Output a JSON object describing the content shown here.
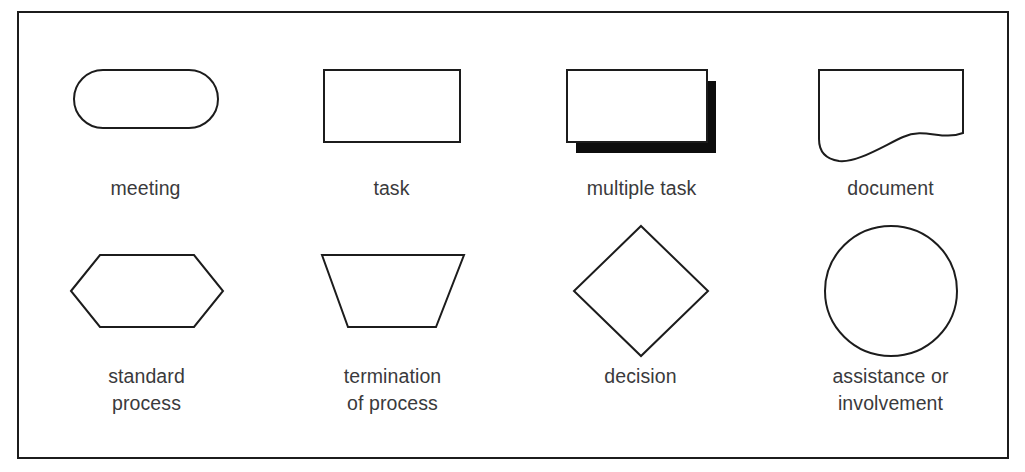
{
  "diagram": {
    "kind": "flowchart-symbol-legend",
    "frame": {
      "border_color": "#1c1c1c",
      "background_color": "#ffffff"
    },
    "label_color": "#3a3a3c",
    "rows": [
      {
        "name": "top-row",
        "items": [
          {
            "id": "meeting",
            "shape": "stadium",
            "label": "meeting"
          },
          {
            "id": "task",
            "shape": "rectangle",
            "label": "task"
          },
          {
            "id": "multiple-task",
            "shape": "stacked-rectangles",
            "label": "multiple task"
          },
          {
            "id": "document",
            "shape": "document-wave",
            "label": "document"
          }
        ]
      },
      {
        "name": "bottom-row",
        "items": [
          {
            "id": "standard-process",
            "shape": "hexagon",
            "label": "standard\nprocess"
          },
          {
            "id": "termination-process",
            "shape": "trapezoid",
            "label": "termination\nof process"
          },
          {
            "id": "decision",
            "shape": "diamond",
            "label": "decision"
          },
          {
            "id": "assistance",
            "shape": "circle",
            "label": "assistance or\ninvolvement"
          }
        ]
      }
    ]
  }
}
